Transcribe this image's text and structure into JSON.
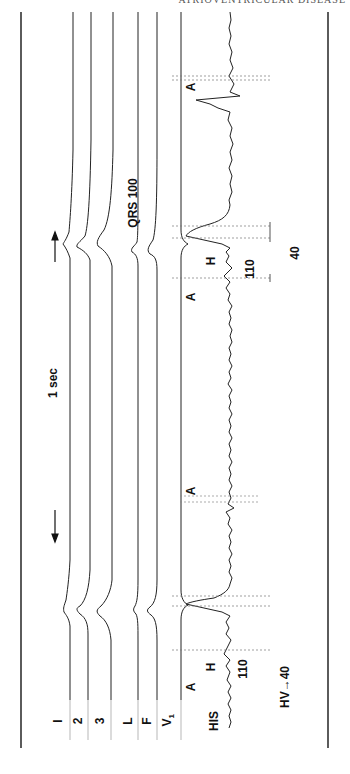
{
  "page": {
    "running_head": "ATRIOVENTRICULAR DISEASE"
  },
  "figure": {
    "leads": [
      {
        "id": "I",
        "label": "I"
      },
      {
        "id": "2",
        "label": "2"
      },
      {
        "id": "3",
        "label": "3"
      },
      {
        "id": "L",
        "label": "L"
      },
      {
        "id": "F",
        "label": "F"
      },
      {
        "id": "V1",
        "label": "V",
        "subscript": "1"
      }
    ],
    "his_label": "HIS",
    "scale_label": "1 sec",
    "annotations": {
      "beat1": {
        "a": "A",
        "h": "H",
        "ah_value": "110",
        "hv_label": "HV",
        "hv_value": "40"
      },
      "beat_mid": {
        "a": "A"
      },
      "beat2": {
        "a": "A",
        "h": "H",
        "ah_value": "110",
        "hv_value": "40",
        "qrs_label": "QRS",
        "qrs_value": "100"
      },
      "beat3": {
        "a": "A"
      }
    },
    "colors": {
      "trace": "#222222",
      "frame": "#333333",
      "background": "#ffffff"
    }
  }
}
